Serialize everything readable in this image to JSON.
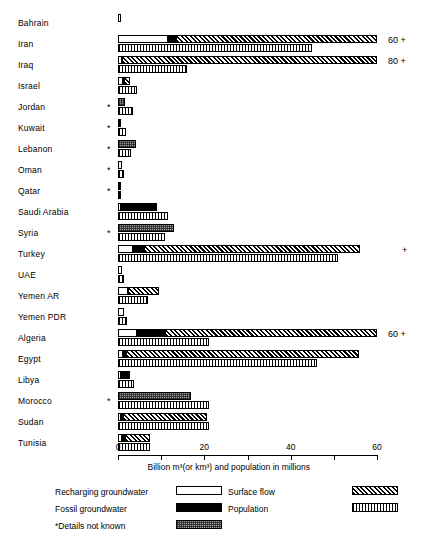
{
  "chart_data": {
    "type": "bar",
    "orientation": "horizontal",
    "title": "",
    "xlabel": "Billion m³(or km³) and population in millions",
    "ylabel": "",
    "xlim": [
      0,
      60
    ],
    "xticks": [
      0,
      10,
      20,
      30,
      40,
      50,
      60
    ],
    "xtick_labels": [
      "0",
      "",
      "20",
      "",
      "40",
      "",
      "60"
    ],
    "grid": false,
    "legend_position": "bottom",
    "series": [
      {
        "name": "Recharging groundwater",
        "key": "recharging",
        "fill": "white"
      },
      {
        "name": "Fossil groundwater",
        "key": "fossil",
        "fill": "black"
      },
      {
        "name": "Surface flow",
        "key": "surface",
        "fill": "diagonal-hatch"
      },
      {
        "name": "Population",
        "key": "population",
        "fill": "cross-hatch-light"
      },
      {
        "name": "*Details not known",
        "key": "unknown",
        "fill": "grey-stipple"
      }
    ],
    "categories": [
      "Bahrain",
      "Iran",
      "Iraq",
      "Israel",
      "Jordan",
      "Kuwait",
      "Lebanon",
      "Oman",
      "Qatar",
      "Saudi Arabia",
      "Syria",
      "Turkey",
      "UAE",
      "Yemen AR",
      "Yemen PDR",
      "Algeria",
      "Egypt",
      "Libya",
      "Morocco",
      "Sudan",
      "Tunisia"
    ],
    "rows": [
      {
        "label": "Bahrain",
        "star": false,
        "recharging": 0.15,
        "fossil": 0,
        "surface": 0,
        "unknown": 0,
        "population": 0,
        "note": ""
      },
      {
        "label": "Iran",
        "star": false,
        "recharging": 11.5,
        "fossil": 2.0,
        "surface": 46.5,
        "unknown": 0,
        "population": 45.0,
        "note": "60 +"
      },
      {
        "label": "Iraq",
        "star": false,
        "recharging": 1.0,
        "fossil": 0,
        "surface": 59.0,
        "unknown": 0,
        "population": 16.0,
        "note": "80 +"
      },
      {
        "label": "Israel",
        "star": false,
        "recharging": 1.1,
        "fossil": 0.3,
        "surface": 1.3,
        "unknown": 0,
        "population": 4.3,
        "note": ""
      },
      {
        "label": "Jordan",
        "star": true,
        "recharging": 0,
        "fossil": 0,
        "surface": 0,
        "unknown": 1.6,
        "population": 3.5,
        "note": ""
      },
      {
        "label": "Kuwait",
        "star": true,
        "recharging": 0,
        "fossil": 0.8,
        "surface": 0,
        "unknown": 0,
        "population": 1.8,
        "note": ""
      },
      {
        "label": "Lebanon",
        "star": true,
        "recharging": 0,
        "fossil": 0,
        "surface": 0,
        "unknown": 4.2,
        "population": 3.0,
        "note": ""
      },
      {
        "label": "Oman",
        "star": true,
        "recharging": 1.0,
        "fossil": 0,
        "surface": 0,
        "unknown": 0,
        "population": 1.3,
        "note": ""
      },
      {
        "label": "Qatar",
        "star": true,
        "recharging": 0,
        "fossil": 0.5,
        "surface": 0,
        "unknown": 0,
        "population": 0.4,
        "note": ""
      },
      {
        "label": "Saudi Arabia",
        "star": false,
        "recharging": 0.8,
        "fossil": 8.2,
        "surface": 0,
        "unknown": 0,
        "population": 11.5,
        "note": ""
      },
      {
        "label": "Syria",
        "star": true,
        "recharging": 0,
        "fossil": 0,
        "surface": 0,
        "unknown": 13.0,
        "population": 11.0,
        "note": ""
      },
      {
        "label": "Turkey",
        "star": false,
        "recharging": 3.5,
        "fossil": 2.5,
        "surface": 50.0,
        "unknown": 0,
        "population": 51.0,
        "note": "+"
      },
      {
        "label": "UAE",
        "star": false,
        "recharging": 0.9,
        "fossil": 0,
        "surface": 0,
        "unknown": 0,
        "population": 1.3,
        "note": ""
      },
      {
        "label": "Yemen AR",
        "star": false,
        "recharging": 2.4,
        "fossil": 0,
        "surface": 7.1,
        "unknown": 0,
        "population": 7.0,
        "note": ""
      },
      {
        "label": "Yemen PDR",
        "star": false,
        "recharging": 1.4,
        "fossil": 0,
        "surface": 0,
        "unknown": 0,
        "population": 2.2,
        "note": ""
      },
      {
        "label": "Algeria",
        "star": false,
        "recharging": 4.5,
        "fossil": 6.5,
        "surface": 49.0,
        "unknown": 0,
        "population": 21.0,
        "note": "60 +"
      },
      {
        "label": "Egypt",
        "star": false,
        "recharging": 1.2,
        "fossil": 0.6,
        "surface": 54.0,
        "unknown": 0,
        "population": 46.0,
        "note": ""
      },
      {
        "label": "Libya",
        "star": false,
        "recharging": 0.4,
        "fossil": 2.3,
        "surface": 0,
        "unknown": 0,
        "population": 3.6,
        "note": ""
      },
      {
        "label": "Morocco",
        "star": true,
        "recharging": 0,
        "fossil": 0,
        "surface": 0,
        "unknown": 17.0,
        "population": 21.0,
        "note": ""
      },
      {
        "label": "Sudan",
        "star": false,
        "recharging": 0.4,
        "fossil": 0.7,
        "surface": 19.5,
        "unknown": 0,
        "population": 21.0,
        "note": ""
      },
      {
        "label": "Tunisia",
        "star": false,
        "recharging": 0.9,
        "fossil": 0.8,
        "surface": 5.6,
        "unknown": 0,
        "population": 7.5,
        "note": ""
      }
    ]
  },
  "legend": {
    "items": [
      {
        "label": "Recharging groundwater",
        "fill": "white",
        "col": 0,
        "row": 0
      },
      {
        "label": "Fossil groundwater",
        "fill": "black",
        "col": 0,
        "row": 1
      },
      {
        "label": "*Details not known",
        "fill": "grey-stipple",
        "col": 0,
        "row": 2
      },
      {
        "label": "Surface flow",
        "fill": "diagonal-hatch",
        "col": 1,
        "row": 0
      },
      {
        "label": "Population",
        "fill": "cross-hatch-light",
        "col": 1,
        "row": 1
      }
    ]
  },
  "axis": {
    "title": "Billion m³(or km³) and population in millions",
    "ticks": [
      {
        "value": 0,
        "label": "0"
      },
      {
        "value": 10,
        "label": ""
      },
      {
        "value": 20,
        "label": "20"
      },
      {
        "value": 30,
        "label": ""
      },
      {
        "value": 40,
        "label": "40"
      },
      {
        "value": 50,
        "label": ""
      },
      {
        "value": 60,
        "label": "60"
      }
    ]
  },
  "colors": {
    "ink": "#000000",
    "paper": "#ffffff",
    "grey": "#9a9a9a"
  }
}
